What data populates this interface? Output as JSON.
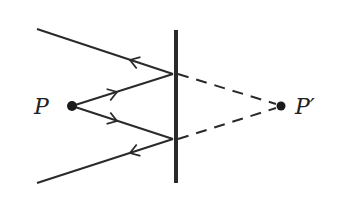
{
  "diagram": {
    "type": "plane-mirror-reflection",
    "colors": {
      "stroke": "#2a2a2a",
      "background": "#ffffff"
    },
    "labels": {
      "object": "P",
      "image": "P′"
    },
    "mirror": {
      "x": 176,
      "y1": 30,
      "y2": 183
    },
    "object_point": {
      "x": 72,
      "y": 106
    },
    "image_point": {
      "x": 281,
      "y": 106
    },
    "rays": [
      {
        "name": "incident-upper",
        "from": [
          72,
          106
        ],
        "to": [
          173,
          74
        ]
      },
      {
        "name": "reflected-upper",
        "from": [
          173,
          74
        ],
        "to": [
          37,
          29
        ]
      },
      {
        "name": "incident-lower",
        "from": [
          72,
          106
        ],
        "to": [
          173,
          139
        ]
      },
      {
        "name": "reflected-lower",
        "from": [
          173,
          139
        ],
        "to": [
          37,
          183
        ]
      }
    ],
    "virtual_rays": [
      {
        "name": "virtual-upper",
        "from": [
          176,
          74
        ],
        "to": [
          281,
          106
        ]
      },
      {
        "name": "virtual-lower",
        "from": [
          176,
          139
        ],
        "to": [
          281,
          106
        ]
      }
    ]
  }
}
